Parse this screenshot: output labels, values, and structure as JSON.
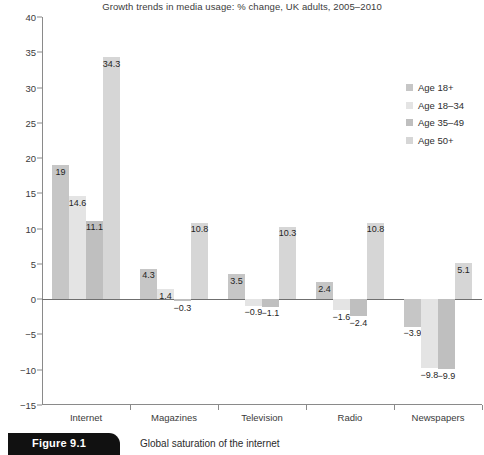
{
  "chart_data": {
    "type": "bar",
    "title": "Growth trends in media usage: % change, UK adults, 2005–2010",
    "xlabel": "",
    "ylabel": "",
    "ylim": [
      -15,
      40
    ],
    "ytick_step": 5,
    "yticks": [
      "40",
      "35",
      "30",
      "25",
      "20",
      "15",
      "10",
      "5",
      "0",
      "−5",
      "−10",
      "−15"
    ],
    "grid": false,
    "legend_position": "top-right",
    "categories": [
      "Internet",
      "Magazines",
      "Television",
      "Radio",
      "Newspapers"
    ],
    "series": [
      {
        "name": "Age 18+",
        "color": "#c6c6c6",
        "values": [
          19,
          4.3,
          3.5,
          2.4,
          -3.9
        ],
        "labels": [
          "19",
          "4.3",
          "3.5",
          "2.4",
          "−3.9"
        ]
      },
      {
        "name": "Age 18–34",
        "color": "#e4e4e4",
        "values": [
          14.6,
          1.4,
          -0.9,
          -1.6,
          -9.8
        ],
        "labels": [
          "14.6",
          "1.4",
          "−0.9",
          "−1.6",
          "−9.8"
        ]
      },
      {
        "name": "Age 35–49",
        "color": "#bfbfbf",
        "values": [
          11.1,
          -0.3,
          -1.1,
          -2.4,
          -9.9
        ],
        "labels": [
          "11.1",
          "−0.3",
          "−1.1",
          "−2.4",
          "−9.9"
        ]
      },
      {
        "name": "Age 50+",
        "color": "#d6d6d6",
        "values": [
          34.3,
          10.8,
          10.3,
          10.8,
          5.1
        ],
        "labels": [
          "34.3",
          "10.8",
          "10.3",
          "10.8",
          "5.1"
        ]
      }
    ]
  },
  "figure": {
    "number": "Figure 9.1",
    "caption": "Global saturation of the internet"
  },
  "colors": {
    "axis": "#8a8a8a",
    "zero_line": "#6f6f6f",
    "text": "#2e2e2e",
    "tab_background": "#111111"
  }
}
